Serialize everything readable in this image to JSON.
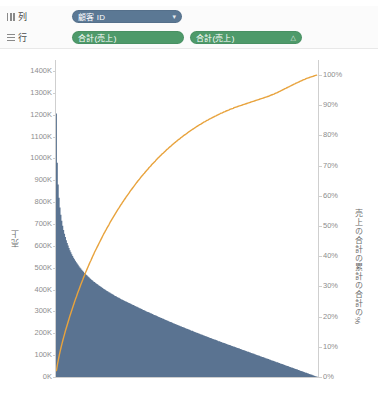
{
  "shelf": {
    "columns": {
      "label": "列",
      "icon": "columns-grid-icon",
      "pill": {
        "text": "顧客 ID",
        "glyph": "▾",
        "color": "#5b7894"
      }
    },
    "rows": {
      "label": "行",
      "icon": "rows-grid-icon",
      "pill1": {
        "text": "合計(売上)",
        "glyph": "",
        "color": "#4e9a6a"
      },
      "pill2": {
        "text": "合計(売上)",
        "glyph": "△",
        "color": "#4e9a6a"
      }
    }
  },
  "chart_data": {
    "type": "bar",
    "title": "",
    "xlabel": "",
    "ylabel": "売上",
    "y2label": "売上の合計の累計の合計の%",
    "ylim": [
      0,
      1450
    ],
    "y2lim": [
      0,
      105
    ],
    "grid": false,
    "legend": "none",
    "bar_color": "#5a7391",
    "line_color": "#E8A33D",
    "refline_color": "#b5b5b5",
    "y_ticks": [
      "0K",
      "100K",
      "200K",
      "300K",
      "400K",
      "500K",
      "600K",
      "700K",
      "800K",
      "900K",
      "1000K",
      "1100K",
      "1200K",
      "1300K",
      "1400K"
    ],
    "y_tick_values": [
      0,
      100,
      200,
      300,
      400,
      500,
      600,
      700,
      800,
      900,
      1000,
      1100,
      1200,
      1300,
      1400
    ],
    "y2_ticks": [
      "0%",
      "10%",
      "20%",
      "30%",
      "40%",
      "50%",
      "60%",
      "70%",
      "80%",
      "90%",
      "100%"
    ],
    "y2_tick_values": [
      0,
      10,
      20,
      30,
      40,
      50,
      60,
      70,
      80,
      90,
      100
    ],
    "annotations": [
      {
        "name": "reference-line-80",
        "label": "80.00%",
        "value": 80,
        "axis": "right"
      }
    ],
    "series": [
      {
        "name": "合計(売上)",
        "type": "bar",
        "values": [
          1205,
          980,
          880,
          820,
          775,
          742,
          715,
          692,
          672,
          655,
          640,
          626,
          613,
          601,
          590,
          580,
          571,
          562,
          554,
          546,
          539,
          532,
          525,
          519,
          513,
          507,
          501,
          496,
          491,
          486,
          481,
          476,
          472,
          468,
          464,
          460,
          456,
          452,
          448,
          444,
          441,
          437,
          434,
          431,
          428,
          425,
          422,
          419,
          416,
          413,
          410,
          407,
          404,
          401,
          399,
          396,
          393,
          391,
          388,
          386,
          383,
          381,
          378,
          376,
          373,
          371,
          369,
          366,
          364,
          362,
          360,
          357,
          355,
          353,
          351,
          349,
          347,
          345,
          343,
          341,
          339,
          337,
          335,
          333,
          331,
          329,
          327,
          325,
          323,
          321,
          319,
          317,
          315,
          313,
          311,
          309,
          307,
          305,
          303,
          301,
          299,
          297,
          296,
          294,
          292,
          290,
          288,
          286,
          284,
          282,
          281,
          279,
          277,
          275,
          273,
          271,
          270,
          268,
          266,
          264,
          262,
          261,
          259,
          257,
          255,
          253,
          252,
          250,
          248,
          246,
          245,
          243,
          241,
          239,
          238,
          236,
          234,
          232,
          231,
          229,
          227,
          226,
          224,
          222,
          221,
          219,
          217,
          216,
          214,
          212,
          211,
          209,
          207,
          206,
          204,
          202,
          201,
          199,
          198,
          196,
          194,
          193,
          191,
          190,
          188,
          186,
          185,
          183,
          182,
          180,
          178,
          177,
          175,
          174,
          172,
          171,
          169,
          168,
          166,
          164,
          163,
          161,
          160,
          158,
          157,
          155,
          154,
          152,
          151,
          149,
          148,
          146,
          145,
          143,
          142,
          140,
          139,
          137,
          136,
          134,
          133,
          131,
          130,
          128,
          127,
          125,
          124,
          122,
          121,
          119,
          118,
          116,
          115,
          113,
          112,
          110,
          109,
          107,
          106,
          104,
          103,
          101,
          100,
          98,
          97,
          95,
          94,
          92,
          91,
          89,
          88,
          86,
          85,
          83,
          82,
          80,
          79,
          77,
          76,
          74,
          73,
          71,
          70,
          68,
          67,
          65,
          64,
          62,
          61,
          59,
          58,
          56,
          55,
          53,
          52,
          50,
          49,
          47,
          46,
          44,
          43,
          41,
          40,
          38,
          37,
          35,
          34,
          32,
          31,
          29,
          28,
          26,
          25,
          23,
          22,
          20,
          19,
          17,
          16,
          14,
          13,
          11,
          10,
          8,
          7,
          5,
          4,
          2,
          1
        ],
        "unit": "K"
      },
      {
        "name": "売上の合計の累計の合計の%",
        "type": "line",
        "axis": "right",
        "unit": "%",
        "values": [
          2.1,
          4.0,
          5.6,
          7.1,
          8.4,
          9.7,
          10.9,
          12.1,
          13.2,
          14.3,
          15.4,
          16.4,
          17.4,
          18.4,
          19.4,
          20.4,
          21.3,
          22.2,
          23.1,
          24.0,
          24.9,
          25.8,
          26.6,
          27.5,
          28.3,
          29.1,
          29.9,
          30.7,
          31.5,
          32.2,
          33.0,
          33.7,
          34.5,
          35.2,
          35.9,
          36.6,
          37.3,
          38.0,
          38.6,
          39.3,
          40.0,
          40.6,
          41.3,
          41.9,
          42.5,
          43.1,
          43.7,
          44.3,
          44.9,
          45.5,
          46.1,
          46.7,
          47.3,
          47.8,
          48.4,
          48.9,
          49.5,
          50.0,
          50.5,
          51.1,
          51.6,
          52.1,
          52.6,
          53.1,
          53.6,
          54.1,
          54.6,
          55.1,
          55.6,
          56.0,
          56.5,
          57.0,
          57.4,
          57.9,
          58.3,
          58.8,
          59.2,
          59.7,
          60.1,
          60.5,
          60.9,
          61.4,
          61.8,
          62.2,
          62.6,
          63.0,
          63.4,
          63.8,
          64.2,
          64.6,
          65.0,
          65.3,
          65.7,
          66.1,
          66.5,
          66.8,
          67.2,
          67.5,
          67.9,
          68.2,
          68.6,
          68.9,
          69.3,
          69.6,
          69.9,
          70.3,
          70.6,
          70.9,
          71.2,
          71.5,
          71.9,
          72.2,
          72.5,
          72.8,
          73.1,
          73.4,
          73.7,
          74.0,
          74.2,
          74.5,
          74.8,
          75.1,
          75.4,
          75.6,
          75.9,
          76.2,
          76.4,
          76.7,
          77.0,
          77.2,
          77.5,
          77.7,
          78.0,
          78.2,
          78.5,
          78.7,
          78.9,
          79.2,
          79.4,
          79.6,
          79.9,
          80.1,
          80.3,
          80.5,
          80.7,
          81.0,
          81.2,
          81.4,
          81.6,
          81.8,
          82.0,
          82.2,
          82.4,
          82.6,
          82.8,
          83.0,
          83.2,
          83.4,
          83.6,
          83.7,
          83.9,
          84.1,
          84.3,
          84.5,
          84.6,
          84.8,
          85.0,
          85.1,
          85.3,
          85.5,
          85.6,
          85.8,
          85.9,
          86.1,
          86.2,
          86.4,
          86.5,
          86.7,
          86.8,
          87.0,
          87.1,
          87.3,
          87.4,
          87.5,
          87.7,
          87.8,
          87.9,
          88.1,
          88.2,
          88.3,
          88.4,
          88.6,
          88.7,
          88.8,
          88.9,
          89.0,
          89.2,
          89.3,
          89.4,
          89.5,
          89.6,
          89.7,
          89.8,
          89.9,
          90.0,
          90.1,
          90.2,
          90.3,
          90.4,
          90.5,
          90.6,
          90.7,
          90.8,
          90.9,
          91.0,
          91.1,
          91.2,
          91.3,
          91.4,
          91.5,
          91.6,
          91.7,
          91.8,
          91.9,
          92.0,
          92.1,
          92.2,
          92.3,
          92.4,
          92.5,
          92.6,
          92.7,
          92.8,
          92.9,
          93.0,
          93.1,
          93.3,
          93.4,
          93.5,
          93.6,
          93.7,
          93.9,
          94.0,
          94.1,
          94.3,
          94.4,
          94.6,
          94.7,
          94.9,
          95.0,
          95.2,
          95.3,
          95.5,
          95.6,
          95.8,
          95.9,
          96.1,
          96.2,
          96.4,
          96.5,
          96.7,
          96.8,
          97.0,
          97.1,
          97.3,
          97.4,
          97.5,
          97.7,
          97.8,
          98.0,
          98.1,
          98.2,
          98.4,
          98.5,
          98.6,
          98.8,
          98.9,
          99.0,
          99.1,
          99.2,
          99.3,
          99.4,
          99.5,
          99.6,
          99.7,
          99.8,
          99.9,
          100.0
        ]
      }
    ]
  }
}
